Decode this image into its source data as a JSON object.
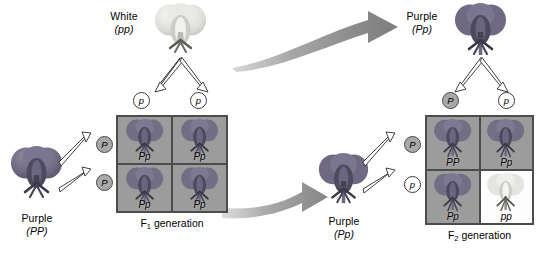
{
  "figure": {
    "colors": {
      "purple_flower": "#6f6a82",
      "white_flower": "#dcdcd8",
      "punnett_background": "#9c9c9c",
      "punnett_border": "#4c4c4c",
      "dominant_allele_fill": "#a9a9a9",
      "recessive_allele_fill": "#ffffff",
      "ribbon_arrow": "#8d8d8d",
      "text": "#000000"
    }
  },
  "parents": {
    "p_female": {
      "label": "White",
      "genotype": "(pp)",
      "flower_color": "white"
    },
    "p_male": {
      "label": "Purple",
      "genotype": "(PP)",
      "flower_color": "purple"
    }
  },
  "f1_parent": {
    "label": "Purple",
    "genotype": "(Pp)",
    "flower_color": "purple"
  },
  "f2_parent": {
    "label": "Purple",
    "genotype": "(Pp)",
    "flower_color": "purple"
  },
  "f1_cross": {
    "generation_label": "F",
    "generation_subscript": "1",
    "generation_suffix": " generation",
    "top_gametes": [
      "p",
      "p"
    ],
    "top_gamete_types": [
      "recessive",
      "recessive"
    ],
    "side_gametes": [
      "P",
      "P"
    ],
    "side_gamete_types": [
      "dominant",
      "dominant"
    ],
    "cells": [
      {
        "genotype": "Pp",
        "phenotype": "purple"
      },
      {
        "genotype": "Pp",
        "phenotype": "purple"
      },
      {
        "genotype": "Pp",
        "phenotype": "purple"
      },
      {
        "genotype": "Pp",
        "phenotype": "purple"
      }
    ]
  },
  "f2_cross": {
    "generation_label": "F",
    "generation_subscript": "2",
    "generation_suffix": " generation",
    "top_gametes": [
      "P",
      "p"
    ],
    "top_gamete_types": [
      "dominant",
      "recessive"
    ],
    "side_gametes": [
      "P",
      "p"
    ],
    "side_gamete_types": [
      "dominant",
      "recessive"
    ],
    "cells": [
      {
        "genotype": "PP",
        "phenotype": "purple"
      },
      {
        "genotype": "Pp",
        "phenotype": "purple"
      },
      {
        "genotype": "Pp",
        "phenotype": "purple"
      },
      {
        "genotype": "pp",
        "phenotype": "white"
      }
    ]
  }
}
